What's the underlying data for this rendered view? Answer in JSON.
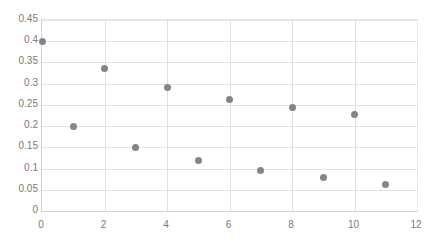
{
  "chart_data": {
    "type": "scatter",
    "title": "",
    "subtitle": "",
    "xlabel": "",
    "ylabel": "",
    "xlim": [
      0,
      12
    ],
    "ylim": [
      0,
      0.45
    ],
    "grid": true,
    "legend": null,
    "legend_position": "none",
    "marker_color": "#7f878c",
    "marker_size_px": 7,
    "gridline_color": "#e4e4e4",
    "axis_color": "#d0d0d0",
    "tick_label_color": "#7a7a7a",
    "x_ticks": [
      "0",
      "2",
      "4",
      "6",
      "8",
      "10",
      "12"
    ],
    "x_tick_values": [
      0,
      2,
      4,
      6,
      8,
      10,
      12
    ],
    "y_ticks": [
      "0",
      "0.05",
      "0.1",
      "0.15",
      "0.2",
      "0.25",
      "0.3",
      "0.35",
      "0.4",
      "0.45"
    ],
    "y_tick_values": [
      0,
      0.05,
      0.1,
      0.15,
      0.2,
      0.25,
      0.3,
      0.35,
      0.4,
      0.45
    ],
    "series": [
      {
        "name": "series-1",
        "x": [
          0,
          1,
          2,
          3,
          4,
          5,
          6,
          7,
          8,
          9,
          10,
          11
        ],
        "y": [
          0.4,
          0.2,
          0.335,
          0.15,
          0.29,
          0.118,
          0.262,
          0.095,
          0.245,
          0.078,
          0.228,
          0.062
        ]
      }
    ],
    "points": [
      {
        "x": 0,
        "y": 0.4
      },
      {
        "x": 1,
        "y": 0.2
      },
      {
        "x": 2,
        "y": 0.335
      },
      {
        "x": 3,
        "y": 0.15
      },
      {
        "x": 4,
        "y": 0.29
      },
      {
        "x": 5,
        "y": 0.118
      },
      {
        "x": 6,
        "y": 0.262
      },
      {
        "x": 7,
        "y": 0.095
      },
      {
        "x": 8,
        "y": 0.245
      },
      {
        "x": 9,
        "y": 0.078
      },
      {
        "x": 10,
        "y": 0.228
      },
      {
        "x": 11,
        "y": 0.062
      }
    ]
  }
}
